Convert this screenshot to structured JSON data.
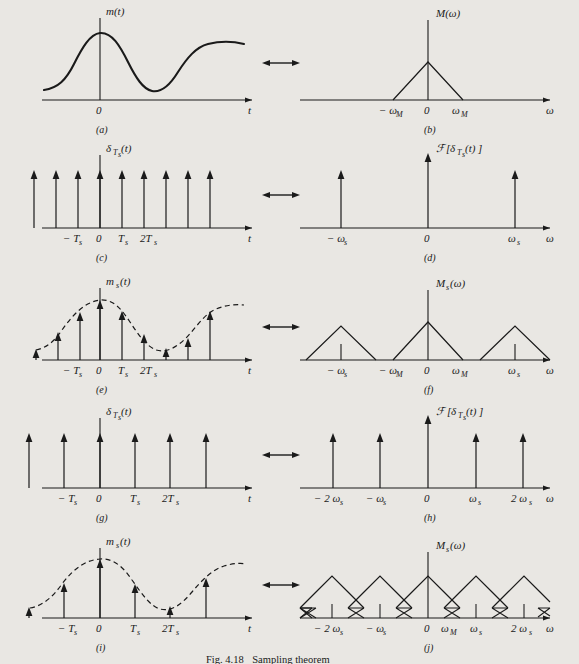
{
  "figure": {
    "caption_label": "Fig. 4.18",
    "caption_text": "Sampling theorem",
    "background_color": "#e9e7e3",
    "ink_color": "#1a1a1a"
  },
  "panels": [
    {
      "id": "a",
      "tag": "(a)",
      "kind": "continuous-signal",
      "signal_label": "m(t)",
      "x_axis_label": "t",
      "origin_label": "0",
      "ticks": []
    },
    {
      "id": "b",
      "tag": "(b)",
      "kind": "single-triangle-spectrum",
      "signal_label": "M(ω)",
      "x_axis_label": "ω",
      "origin_label": "0",
      "ticks": [
        "− ω",
        "M",
        "ω",
        "M"
      ],
      "tick_labels": [
        "−ωₘ",
        "0",
        "ωₘ"
      ]
    },
    {
      "id": "c",
      "tag": "(c)",
      "kind": "impulse-train-time",
      "signal_label": "δ",
      "signal_sub": "T",
      "signal_sub2": "s",
      "signal_tail": "(t)",
      "x_axis_label": "t",
      "origin_label": "0",
      "tick_labels": [
        "−T",
        "0",
        "T",
        "2T"
      ],
      "impulse_count": 9
    },
    {
      "id": "d",
      "tag": "(d)",
      "kind": "impulse-train-freq",
      "signal_label": "ℱ[δ",
      "x_axis_label": "ω",
      "origin_label": "0",
      "tick_labels": [
        "− ωₛ",
        "0",
        "ωₛ"
      ],
      "impulse_count": 3
    },
    {
      "id": "e",
      "tag": "(e)",
      "kind": "sampled-signal",
      "signal_label": "m",
      "signal_sub": "s",
      "signal_tail": "(t)",
      "x_axis_label": "t",
      "origin_label": "0",
      "tick_labels": [
        "−T",
        "0",
        "T",
        "2T"
      ],
      "impulse_count": 9
    },
    {
      "id": "f",
      "tag": "(f)",
      "kind": "replicated-spectrum-separated",
      "signal_label": "M",
      "signal_sub": "s",
      "signal_tail": "(ω)",
      "x_axis_label": "ω",
      "origin_label": "0",
      "tick_labels": [
        "− ωₛ",
        "− ωₘ",
        "0",
        "ωₘ",
        "ωₛ"
      ],
      "triangle_count": 3
    },
    {
      "id": "g",
      "tag": "(g)",
      "kind": "impulse-train-time",
      "signal_label": "δ",
      "signal_sub": "T",
      "signal_sub2": "s",
      "signal_tail": "(t)",
      "x_axis_label": "t",
      "origin_label": "0",
      "tick_labels": [
        "−T",
        "0",
        "T",
        "2T"
      ],
      "impulse_count": 6
    },
    {
      "id": "h",
      "tag": "(h)",
      "kind": "impulse-train-freq",
      "signal_label": "ℱ[δ",
      "x_axis_label": "ω",
      "origin_label": "0",
      "tick_labels": [
        "−2 ωₛ",
        "− ωₛ",
        "0",
        "ωₛ",
        "2 ωₛ"
      ],
      "impulse_count": 5
    },
    {
      "id": "i",
      "tag": "(i)",
      "kind": "sampled-signal",
      "signal_label": "m",
      "signal_sub": "s",
      "signal_tail": "(t)",
      "x_axis_label": "t",
      "origin_label": "0",
      "tick_labels": [
        "−T",
        "0",
        "T",
        "2T"
      ],
      "impulse_count": 6
    },
    {
      "id": "j",
      "tag": "(j)",
      "kind": "replicated-spectrum-aliased",
      "signal_label": "M",
      "signal_sub": "s",
      "signal_tail": "(ω)",
      "x_axis_label": "ω",
      "origin_label": "0",
      "tick_labels": [
        "−2 ωₛ",
        "− ωₛ",
        "0",
        "ωₘ",
        "ωₛ",
        "2 ωₛ"
      ],
      "triangle_count": 7
    }
  ],
  "arrows": {
    "symbol": "⟷",
    "count": 5,
    "meaning": "fourier-transform-pair"
  },
  "text_tokens": {
    "m_t": "m(t)",
    "M_omega": "M(ω)",
    "delta_T": "δ",
    "T_sub": "T",
    "s_sub": "s",
    "paren_t": "(t)",
    "script_F": "ℱ",
    "bracket_open": "[",
    "bracket_close": "]",
    "m_s": "m",
    "M_s": "M",
    "paren_omega": "(ω)",
    "t": "t",
    "omega": "ω",
    "zero": "0",
    "minus": "−",
    "two": "2",
    "omega_M": "ω",
    "M_subscript": "M",
    "s_subscript": "s"
  },
  "axis_tick_text": {
    "neg_Ts": "− T",
    "Ts": "T",
    "two_Ts": "2T",
    "neg_wM": "− ω",
    "wM": "ω",
    "neg_ws": "− ω",
    "ws": "ω",
    "neg_2ws": "− 2 ω",
    "two_ws": "2 ω"
  }
}
